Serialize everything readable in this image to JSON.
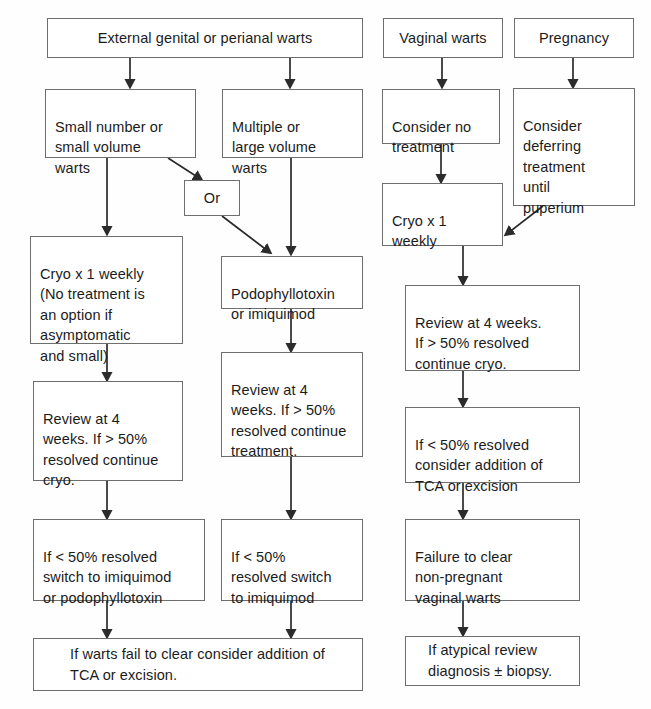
{
  "diagram": {
    "background_color": "#fefefe",
    "box_border_color": "#6e6e6e",
    "text_color": "#1b1b1b",
    "nodes": {
      "external_warts": "External genital or perianal warts",
      "vaginal_warts": "Vaginal warts",
      "pregnancy": "Pregnancy",
      "small_number": "Small number or\nsmall volume\nwarts",
      "multiple_large": "Multiple or\nlarge volume\nwarts",
      "consider_no_treatment": "Consider no\ntreatment",
      "consider_deferring": "Consider\ndeferring\ntreatment\nuntil\npuperium",
      "or_connector": "Or",
      "cryo_vaginal": "Cryo x 1\nweekly",
      "cryo_weekly_option": "Cryo x 1 weekly\n(No treatment is\nan option if\nasymptomatic\nand small)",
      "podophyllotoxin": "Podophyllotoxin\nor imiquimod",
      "review_vaginal": "Review at 4 weeks.\nIf > 50% resolved\ncontinue cryo.",
      "review_podo": "Review at 4\nweeks. If  > 50%\nresolved continue\ntreatment.",
      "review_cryo": "Review at 4\nweeks. If > 50%\nresolved continue\ncryo.",
      "less50_vaginal": "If < 50% resolved\nconsider addition of\nTCA or excision",
      "less50_left": "If < 50% resolved\nswitch to imiquimod\nor podophyllotoxin",
      "less50_middle": "If < 50%\nresolved switch\nto imiquimod",
      "failure_clear": "Failure to clear\nnon-pregnant\nvaginal warts",
      "warts_fail": "If warts fail to clear consider addition of\nTCA or excision.",
      "atypical_review": "If atypical review\ndiagnosis ± biopsy."
    }
  }
}
